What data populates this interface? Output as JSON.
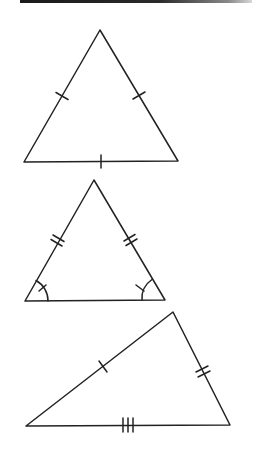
{
  "figure": {
    "stroke_color": "#222222",
    "background": "#ffffff",
    "triangles": [
      {
        "name": "equilateral",
        "vertices": [
          [
            100,
            30
          ],
          [
            24,
            162
          ],
          [
            178,
            161
          ]
        ],
        "side_ticks": {
          "left": 1,
          "right": 1,
          "base": 1
        },
        "angle_marks": []
      },
      {
        "name": "isosceles",
        "vertices": [
          [
            94,
            180
          ],
          [
            25,
            301
          ],
          [
            165,
            300
          ]
        ],
        "side_ticks": {
          "left": 2,
          "right": 2,
          "base": 0
        },
        "angle_marks": [
          "bottom-left",
          "bottom-right"
        ]
      },
      {
        "name": "scalene",
        "vertices": [
          [
            173,
            312
          ],
          [
            26,
            426
          ],
          [
            230,
            425
          ]
        ],
        "side_ticks": {
          "left": 1,
          "right": 2,
          "base": 3
        },
        "angle_marks": []
      }
    ]
  }
}
